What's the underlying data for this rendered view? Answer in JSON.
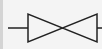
{
  "diagram": {
    "symbol": "gate-valve-icon",
    "colors": {
      "background": "#f4f4f4",
      "stroke": "#222222",
      "left_strip": "#d4d4d4"
    }
  }
}
